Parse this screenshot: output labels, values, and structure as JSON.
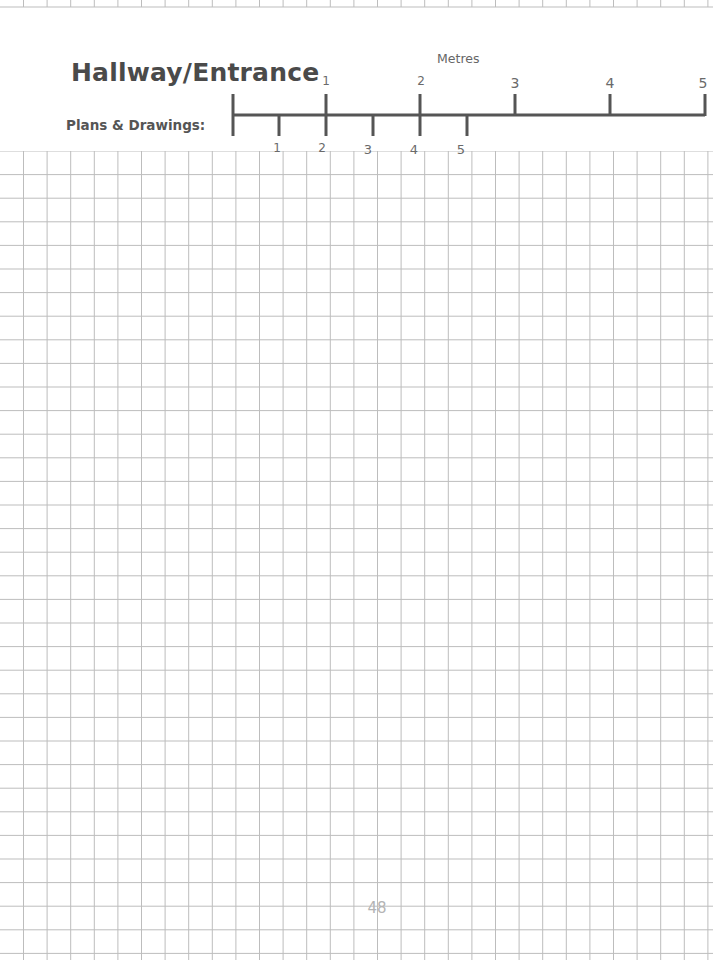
{
  "page": {
    "title": "Hallway/Entrance",
    "subtitle": "Plans & Drawings:",
    "page_number": "48"
  },
  "scale_bar": {
    "units_label": "Metres",
    "upper_scale": {
      "labels": [
        "1",
        "2",
        "3",
        "4",
        "5"
      ],
      "tick_x": [
        233,
        326,
        420,
        515,
        610,
        705
      ]
    },
    "lower_scale": {
      "labels": [
        "1",
        "2",
        "3",
        "4",
        "5"
      ],
      "tick_x": [
        279,
        326,
        373,
        420,
        467
      ]
    },
    "bar_color": "#555555"
  },
  "grid": {
    "line_color": "#bdbdbd",
    "cell_size_px": 23.6,
    "top_y": 151,
    "columns": 30,
    "rows": 34
  }
}
